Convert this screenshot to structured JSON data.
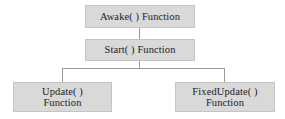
{
  "diagram": {
    "type": "flowchart",
    "background_color": "#ffffff",
    "node_fill_color": "#d9d9d9",
    "node_border_color": "#c4c4c4",
    "connector_color": "#9a9a9a",
    "text_color": "#1c1c1c",
    "nodes": [
      {
        "id": "awake",
        "label": "Awake( ) Function",
        "level": 0
      },
      {
        "id": "start",
        "label": "Start( ) Function",
        "level": 1
      },
      {
        "id": "update",
        "label": "Update( )\nFunction",
        "level": 2
      },
      {
        "id": "fixedupdate",
        "label": "FixedUpdate( )\nFunction",
        "level": 2
      }
    ],
    "edges": [
      {
        "from": "awake",
        "to": "start"
      },
      {
        "from": "start",
        "to": "update"
      },
      {
        "from": "start",
        "to": "fixedupdate"
      }
    ]
  }
}
